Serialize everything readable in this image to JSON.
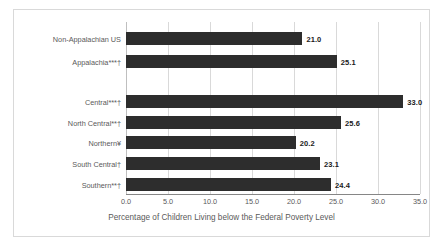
{
  "chart_data": {
    "type": "bar",
    "orientation": "horizontal",
    "title": "",
    "xlabel": "Percentage of Children Living below the Federal Poverty Level",
    "ylabel": "",
    "xlim": [
      0,
      35
    ],
    "xticks": [
      "0.0",
      "5.0",
      "10.0",
      "15.0",
      "20.0",
      "25.0",
      "30.0",
      "35.0"
    ],
    "xtick_values": [
      0,
      5,
      10,
      15,
      20,
      25,
      30,
      35
    ],
    "grid": "vertical",
    "legend": "none",
    "categories": [
      "Non-Appalachian US",
      "Appalachia***†",
      "Central***†",
      "North Central**†",
      "Northern¥",
      "South Central†",
      "Southern**†"
    ],
    "values": [
      21.0,
      25.1,
      33.0,
      25.6,
      20.2,
      23.1,
      24.4
    ],
    "value_labels": [
      "21.0",
      "25.1",
      "33.0",
      "25.6",
      "20.2",
      "23.1",
      "24.4"
    ],
    "bar_color": "#2d2d2d",
    "grid_color": "#d9d9d9",
    "text_color": "#5a5a5a",
    "group_break_after_index": 1
  },
  "rows": [
    {
      "label": "Non-Appalachian US",
      "value": 21.0,
      "value_label": "21.0",
      "top": 22
    },
    {
      "label": "Appalachia***†",
      "value": 25.1,
      "value_label": "25.1",
      "top": 45
    },
    {
      "label": "Central***†",
      "value": 33.0,
      "value_label": "33.0",
      "top": 85
    },
    {
      "label": "North Central**†",
      "value": 25.6,
      "value_label": "25.6",
      "top": 106
    },
    {
      "label": "Northern¥",
      "value": 20.2,
      "value_label": "20.2",
      "top": 126
    },
    {
      "label": "South Central†",
      "value": 23.1,
      "value_label": "23.1",
      "top": 147
    },
    {
      "label": "Southern**†",
      "value": 24.4,
      "value_label": "24.4",
      "top": 168
    }
  ],
  "axis": {
    "title": "Percentage of Children Living below the Federal Poverty Level",
    "ticks": [
      "0.0",
      "5.0",
      "10.0",
      "15.0",
      "20.0",
      "25.0",
      "30.0",
      "35.0"
    ]
  }
}
